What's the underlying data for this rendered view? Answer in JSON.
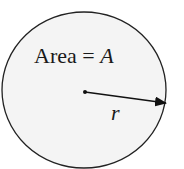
{
  "diagram": {
    "area_label": "Area = ",
    "area_symbol": "A",
    "radius_label": "r",
    "colors": {
      "fill": "#f4f4f4",
      "stroke": "#222222"
    }
  }
}
